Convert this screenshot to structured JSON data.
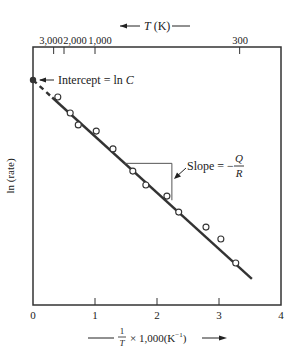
{
  "chart_data": {
    "type": "scatter",
    "title": "",
    "xlabel": "1/T × 1,000(K⁻¹)",
    "ylabel": "ln (rate)",
    "top_axis_label": "T (K)",
    "xlim": [
      0,
      4
    ],
    "ylim": [
      0,
      10
    ],
    "x_ticks": [
      0,
      1,
      2,
      3,
      4
    ],
    "x_tick_labels": [
      "0",
      "1",
      "2",
      "3",
      "4"
    ],
    "top_ticks": [
      {
        "label": "3,000",
        "x": 0.333
      },
      {
        "label": "2,000",
        "x": 0.5
      },
      {
        "label": "1,000",
        "x": 1.0
      },
      {
        "label": "300",
        "x": 3.333
      }
    ],
    "grid": false,
    "legend": null,
    "series": [
      {
        "name": "Measured data",
        "marker": "open-circle",
        "x": [
          0.4,
          0.6,
          0.73,
          1.02,
          1.29,
          1.61,
          1.82,
          2.16,
          2.35,
          2.79,
          3.03,
          3.27
        ],
        "y": [
          8.06,
          7.44,
          6.98,
          6.74,
          6.05,
          5.19,
          4.65,
          4.22,
          3.6,
          3.02,
          2.56,
          1.63
        ]
      }
    ],
    "fit_line": {
      "name": "Arrhenius fit",
      "x": [
        0,
        3.53
      ],
      "y": [
        8.72,
        1.01
      ],
      "dashed_segment_x": [
        0,
        0.31
      ]
    },
    "intercept_point": {
      "x": 0,
      "y": 8.72
    },
    "annotations": [
      {
        "text": "Intercept = ln C",
        "points_to": "intercept_point"
      },
      {
        "text": "Slope = − Q / R",
        "points_to": "slope_triangle"
      }
    ],
    "slope_triangle": {
      "x0": 1.48,
      "x1": 2.24,
      "y_top": 5.49,
      "y_bottom": 4.06
    }
  },
  "labels": {
    "top_axis_prefix_arrow": "←",
    "top_axis_var": "T",
    "top_axis_unit": " (K)",
    "top_axis_suffix_dash": "—",
    "intercept_prefix": "Intercept = ln ",
    "intercept_var": "C",
    "slope_prefix": "Slope = −",
    "slope_num": "Q",
    "slope_den": "R",
    "y_axis": "ln (rate)",
    "x_axis_frac_num": "1",
    "x_axis_frac_den": "T",
    "x_axis_rest": "× 1,000(K",
    "x_axis_sup": "−1",
    "x_axis_close": ")"
  }
}
